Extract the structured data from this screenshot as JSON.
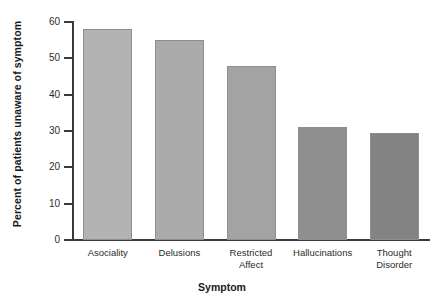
{
  "chart_data": {
    "type": "bar",
    "title": "",
    "xlabel": "Symptom",
    "ylabel": "Percent of patients unaware of symptom",
    "categories": [
      "Asociality",
      "Delusions",
      "Restricted Affect",
      "Hallucinations",
      "Thought Disorder"
    ],
    "category_lines": [
      [
        "Asociality"
      ],
      [
        "Delusions"
      ],
      [
        "Restricted",
        "Affect"
      ],
      [
        "Hallucinations"
      ],
      [
        "Thought",
        "Disorder"
      ]
    ],
    "values": [
      58,
      55,
      48,
      31,
      29.5
    ],
    "ylim": [
      0,
      60
    ],
    "yticks": [
      0,
      10,
      20,
      30,
      40,
      50,
      60
    ],
    "ytick_labels": [
      "0",
      "10",
      "20",
      "30",
      "40",
      "50",
      "60"
    ],
    "grid": false,
    "legend": "none",
    "bar_colors": [
      "#b3b3b3",
      "#ababab",
      "#a3a3a3",
      "#8f8f8f",
      "#838383"
    ],
    "bar_border_color": "#8e8e8e",
    "axis_color": "#3a3a3a",
    "background": "#ffffff"
  }
}
